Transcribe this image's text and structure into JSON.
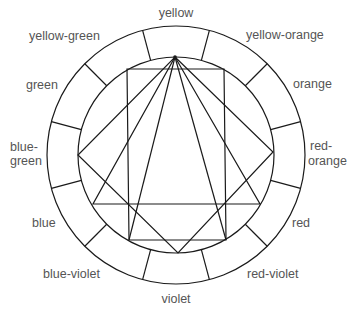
{
  "diagram": {
    "center": [
      176,
      155
    ],
    "outer_radius": 129,
    "inner_radius": 98,
    "segments": 12,
    "labels": [
      {
        "text": "yellow",
        "x": 176,
        "y": 17,
        "anchor": "middle"
      },
      {
        "text": "yellow-orange",
        "x": 246,
        "y": 39,
        "anchor": "start"
      },
      {
        "text": "orange",
        "x": 293,
        "y": 88,
        "anchor": "start"
      },
      {
        "text": "red-",
        "x": 310,
        "y": 150,
        "anchor": "start"
      },
      {
        "text": "orange",
        "x": 308,
        "y": 165,
        "anchor": "start"
      },
      {
        "text": "red",
        "x": 292,
        "y": 227,
        "anchor": "start"
      },
      {
        "text": "red-violet",
        "x": 247,
        "y": 278,
        "anchor": "start"
      },
      {
        "text": "violet",
        "x": 176,
        "y": 303,
        "anchor": "middle"
      },
      {
        "text": "blue-violet",
        "x": 43,
        "y": 278,
        "anchor": "start"
      },
      {
        "text": "blue",
        "x": 32,
        "y": 227,
        "anchor": "start"
      },
      {
        "text": "blue-",
        "x": 10,
        "y": 151,
        "anchor": "start"
      },
      {
        "text": "green",
        "x": 10,
        "y": 165,
        "anchor": "start"
      },
      {
        "text": "green",
        "x": 26,
        "y": 89,
        "anchor": "start"
      },
      {
        "text": "yellow-green",
        "x": 29,
        "y": 40,
        "anchor": "start"
      }
    ],
    "shapes": {
      "apex": [
        175,
        57
      ],
      "square": [
        [
          175,
          57
        ],
        [
          273,
          152
        ],
        [
          178,
          253
        ],
        [
          78,
          155
        ]
      ],
      "triangle": [
        [
          175,
          57
        ],
        [
          260,
          204
        ],
        [
          93,
          204
        ]
      ],
      "rectangle": [
        [
          127,
          69
        ],
        [
          224,
          69
        ],
        [
          226,
          240
        ],
        [
          129,
          240
        ]
      ],
      "extra_lines": [
        [
          [
            175,
            57
          ],
          [
            129,
            240
          ]
        ],
        [
          [
            175,
            57
          ],
          [
            226,
            240
          ]
        ]
      ]
    }
  }
}
